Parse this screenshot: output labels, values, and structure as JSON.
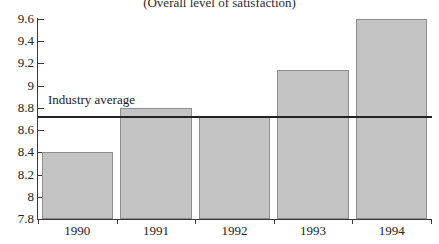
{
  "chart_data": {
    "type": "bar",
    "title": "(Overall level of satisfaction)",
    "xlabel": "",
    "ylabel": "",
    "categories": [
      "1990",
      "1991",
      "1992",
      "1993",
      "1994"
    ],
    "values": [
      8.4,
      8.8,
      8.72,
      9.14,
      9.6
    ],
    "ylim": [
      7.8,
      9.6
    ],
    "ytick_values": [
      9.6,
      9.4,
      9.2,
      9.0,
      8.8,
      8.6,
      8.4,
      8.2,
      8.0,
      7.8
    ],
    "ytick_labels": [
      "9.6",
      "9.4",
      "9.2",
      "9",
      "8.8",
      "8.6",
      "8.4",
      "8.2",
      "8",
      "7.8"
    ],
    "grid": false,
    "legend": false,
    "annotations": [
      {
        "name": "industry-average",
        "label": "Industry average",
        "value": 8.72,
        "type": "horizontal-reference-line"
      }
    ],
    "colors": {
      "bar_fill": "#c4c4c4",
      "bar_border": "#8d8d8d",
      "axis": "#3a3a3a",
      "reference_line": "#232323",
      "text": "#232323",
      "background": "#ffffff"
    }
  }
}
